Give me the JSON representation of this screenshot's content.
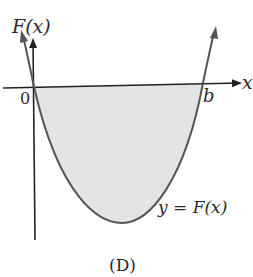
{
  "diagram": {
    "caption": "(D)",
    "y_axis_label": "F(x)",
    "x_axis_label": "x",
    "origin_label": "0",
    "root_label": "b",
    "curve_label": "y = F(x)",
    "colors": {
      "curve": "#555555",
      "axes": "#222222",
      "shading": "#e4e4e4",
      "text": "#2a2a2a"
    }
  }
}
